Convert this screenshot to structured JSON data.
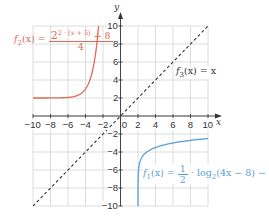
{
  "chart_data": {
    "type": "line",
    "title": "",
    "xlabel": "x",
    "ylabel": "y",
    "xlim": [
      -10,
      10
    ],
    "ylim": [
      -10,
      10
    ],
    "grid": true,
    "x_ticks": [
      -10,
      -8,
      -6,
      -4,
      -2,
      0,
      2,
      4,
      6,
      8,
      10
    ],
    "y_ticks": [
      -10,
      -8,
      -6,
      -4,
      -2,
      2,
      4,
      6,
      8,
      10
    ],
    "x_tick_labels": [
      "−10",
      "−8",
      "−6",
      "−4",
      "−2",
      "0",
      "2",
      "4",
      "6",
      "8",
      "10"
    ],
    "y_tick_labels": [
      "−10",
      "−8",
      "−6",
      "−4",
      "−2",
      "2",
      "4",
      "6",
      "8",
      "10"
    ],
    "series": [
      {
        "name": "f1",
        "label": "f1(x) = 1/2 · log2(4x − 8) − 5",
        "color": "#5b9fd4",
        "style": "solid",
        "domain": [
          2,
          10
        ],
        "x": [
          2.0005,
          2.01,
          2.05,
          2.1,
          2.25,
          2.5,
          3,
          4,
          5,
          6,
          7,
          8,
          9,
          10
        ],
        "y": [
          -10,
          -6.5,
          -5.33,
          -4.83,
          -4.0,
          -3.5,
          -3.0,
          -2.5,
          -2.21,
          -2.0,
          -1.84,
          -1.71,
          -1.6,
          -1.5
        ]
      },
      {
        "name": "f2",
        "label": "f2(x) = (2^(2·(x+5)) + 8) / 4",
        "color": "#e06a5a",
        "style": "solid",
        "domain": [
          -10,
          -1.8
        ],
        "x": [
          -10,
          -8,
          -6,
          -5,
          -4,
          -3,
          -2.5,
          -2.2,
          -2,
          -1.8
        ],
        "y": [
          2.0,
          2.0,
          2.06,
          2.25,
          3.0,
          6.0,
          10.0,
          12.0,
          18.0,
          26.0
        ]
      },
      {
        "name": "f3",
        "label": "f3(x) = x",
        "color": "#333333",
        "style": "dashed",
        "domain": [
          -10,
          10
        ],
        "x": [
          -10,
          10
        ],
        "y": [
          -10,
          10
        ]
      }
    ]
  },
  "labels": {
    "y_axis": "y",
    "x_axis": "x",
    "f1": {
      "name": "f",
      "sub": "1",
      "arg": "(x) = ",
      "frac_num": "1",
      "frac_den": "2",
      "rest": " · log",
      "log_sub": "2",
      "rest2": "(4x − 8) − 5"
    },
    "f2": {
      "name": "f",
      "sub": "2",
      "arg": "(x) = ",
      "base": "2",
      "exp": "2 · (x + 5)",
      "plus": " + 8",
      "den": "4"
    },
    "f3": {
      "name": "f",
      "sub": "3",
      "arg": "(x) = x"
    }
  }
}
